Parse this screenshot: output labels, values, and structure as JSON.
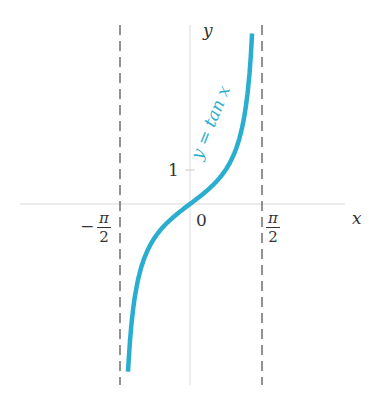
{
  "chart_data": {
    "type": "line",
    "title": "",
    "function": "y = tan x",
    "xlabel": "x",
    "ylabel": "y",
    "x_ticks": [
      "-π/2",
      "0",
      "π/2"
    ],
    "y_ticks": [
      "1"
    ],
    "asymptotes": [
      "x = -π/2",
      "x = π/2"
    ],
    "curve_label": "y = tan x",
    "curve_color": "#2aaed0",
    "domain": [
      -1.4,
      1.52
    ],
    "grid": false
  },
  "labels": {
    "y_axis": "y",
    "x_axis": "x",
    "origin": "0",
    "one": "1",
    "pi": "π",
    "two": "2",
    "minus": "−",
    "curve": "y = tan x"
  }
}
